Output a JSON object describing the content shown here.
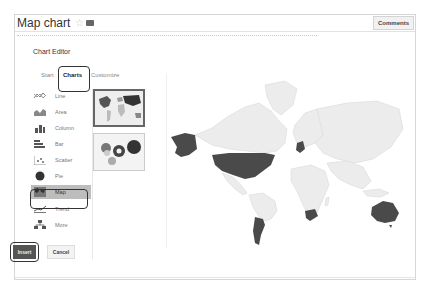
{
  "document": {
    "title": "Map chart",
    "star_icon": "star-icon",
    "folder_icon": "folder-icon",
    "comments_label": "Comments"
  },
  "chart_editor": {
    "title": "Chart Editor",
    "tabs": [
      {
        "label": "Start",
        "active": false
      },
      {
        "label": "Charts",
        "active": true
      },
      {
        "label": "Customize",
        "active": false
      }
    ],
    "chart_types": [
      {
        "label": "Line",
        "icon": "line-chart-icon",
        "selected": false
      },
      {
        "label": "Area",
        "icon": "area-chart-icon",
        "selected": false
      },
      {
        "label": "Column",
        "icon": "column-chart-icon",
        "selected": false
      },
      {
        "label": "Bar",
        "icon": "bar-chart-icon",
        "selected": false
      },
      {
        "label": "Scatter",
        "icon": "scatter-chart-icon",
        "selected": false
      },
      {
        "label": "Pie",
        "icon": "pie-chart-icon",
        "selected": false
      },
      {
        "label": "Map",
        "icon": "map-chart-icon",
        "selected": true
      },
      {
        "label": "Trend",
        "icon": "trend-chart-icon",
        "selected": false
      },
      {
        "label": "More",
        "icon": "more-charts-icon",
        "selected": false
      }
    ],
    "thumbnails": [
      {
        "name": "geo-region-map",
        "selected": true
      },
      {
        "name": "geo-marker-map",
        "selected": false
      }
    ],
    "preview": {
      "type": "geo-chart",
      "highlighted_regions": [
        "United States",
        "Alaska",
        "Germany",
        "Argentina",
        "South Africa",
        "Australia"
      ],
      "highlight_color": "#4a4a4a",
      "base_color": "#ececec"
    },
    "insert_label": "Insert",
    "cancel_label": "Cancel"
  }
}
